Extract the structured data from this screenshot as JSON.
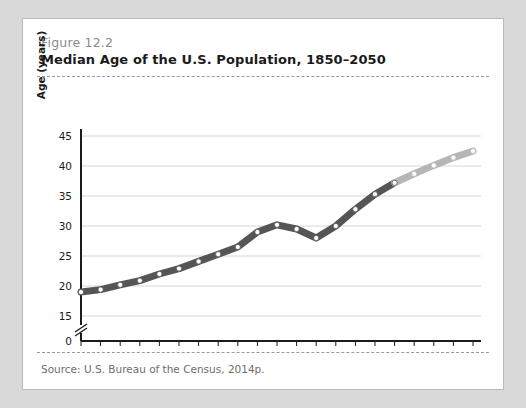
{
  "figure": {
    "number_label": "Figure 12.2",
    "title": "Median Age of the U.S. Population, 1850–2050",
    "source": "Source: U.S. Bureau of the Census, 2014p."
  },
  "chart_data": {
    "type": "line",
    "title": "Median Age of the U.S. Population, 1850–2050",
    "xlabel": "",
    "ylabel": "Age (years)",
    "xlim": [
      1850,
      2050
    ],
    "ylim": [
      15,
      46
    ],
    "y_axis_break": true,
    "y_break_from": 0,
    "y_break_to": 15,
    "grid": true,
    "legend": "none",
    "x_tick_labels": [
      "1850",
      "1870",
      "1890",
      "1910",
      "1930",
      "1950",
      "1970",
      "1990",
      "2010",
      "2030",
      "2050"
    ],
    "x_minor_tick_step": 10,
    "y_tick_labels": [
      "0",
      "15",
      "20",
      "25",
      "30",
      "35",
      "40",
      "45"
    ],
    "x": [
      1850,
      1860,
      1870,
      1880,
      1890,
      1900,
      1910,
      1920,
      1930,
      1940,
      1950,
      1960,
      1970,
      1980,
      1990,
      2000,
      2010,
      2020,
      2030,
      2040,
      2050
    ],
    "values": [
      19.0,
      19.4,
      20.2,
      20.9,
      22.0,
      22.9,
      24.1,
      25.3,
      26.5,
      29.0,
      30.2,
      29.5,
      28.0,
      30.0,
      32.8,
      35.3,
      37.2,
      38.7,
      40.1,
      41.4,
      42.5
    ],
    "series": [
      {
        "name": "Actual",
        "color": "#555555",
        "x": [
          1850,
          1860,
          1870,
          1880,
          1890,
          1900,
          1910,
          1920,
          1930,
          1940,
          1950,
          1960,
          1970,
          1980,
          1990,
          2000,
          2010
        ],
        "values": [
          19.0,
          19.4,
          20.2,
          20.9,
          22.0,
          22.9,
          24.1,
          25.3,
          26.5,
          29.0,
          30.2,
          29.5,
          28.0,
          30.0,
          32.8,
          35.3,
          37.2
        ]
      },
      {
        "name": "Estimated",
        "color": "#b6b6b6",
        "x": [
          2010,
          2020,
          2030,
          2040,
          2050
        ],
        "values": [
          37.2,
          38.7,
          40.1,
          41.4,
          42.5
        ]
      }
    ],
    "annotations": [
      {
        "text": "estimated",
        "bracket_from": 2020,
        "bracket_to": 2050
      }
    ]
  }
}
